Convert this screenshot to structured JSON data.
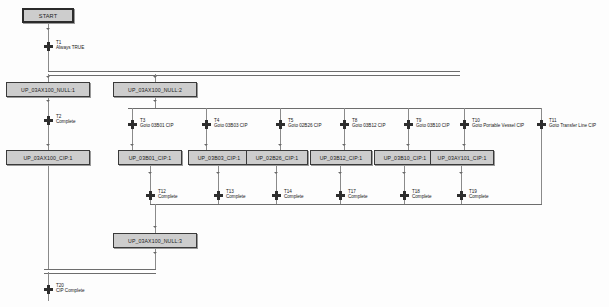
{
  "diagram": {
    "type": "sequential-function-chart",
    "colors": {
      "step_fill": "#cdcdcd",
      "step_border": "#3a3a3a",
      "link": "#8a8a8a",
      "transition": "#2e2e2e",
      "background": "#fdfdfd"
    }
  },
  "steps": [
    {
      "id": "start",
      "label": "START",
      "x": 22,
      "y": 8,
      "w": 52,
      "h": 15,
      "kind": "initial"
    },
    {
      "id": "null1",
      "label": "UP_03AX100_NULL:1",
      "x": 6,
      "y": 82,
      "w": 84,
      "h": 15,
      "kind": "step"
    },
    {
      "id": "null2",
      "label": "UP_03AX100_NULL:2",
      "x": 113,
      "y": 82,
      "w": 84,
      "h": 15,
      "kind": "step"
    },
    {
      "id": "cipAX100",
      "label": "UP_03AX100_CIP:1",
      "x": 6,
      "y": 150,
      "w": 84,
      "h": 15,
      "kind": "step"
    },
    {
      "id": "cip03B01",
      "label": "UP_03B01_CIP:1",
      "x": 116,
      "y": 150,
      "w": 64,
      "h": 15,
      "kind": "step"
    },
    {
      "id": "cip03B03",
      "label": "UP_03B03_CIP:1",
      "x": 190,
      "y": 150,
      "w": 64,
      "h": 15,
      "kind": "step"
    },
    {
      "id": "cip02B26",
      "label": "UP_02B26_CIP:1",
      "x": 258,
      "y": 150,
      "w": 64,
      "h": 15,
      "kind": "step"
    },
    {
      "id": "cip03B12",
      "label": "UP_03B12_CIP:1",
      "x": 332,
      "y": 150,
      "w": 64,
      "h": 15,
      "kind": "step"
    },
    {
      "id": "cip03B10",
      "label": "UP_03B10_CIP:1",
      "x": 400,
      "y": 150,
      "w": 60,
      "h": 15,
      "kind": "step"
    },
    {
      "id": "cip03AY101",
      "label": "UP_03AY101_CIP:1",
      "x": 428,
      "y": 150,
      "w": 66,
      "h": 15,
      "kind": "step"
    },
    {
      "id": "null3",
      "label": "UP_03AX100_NULL:3",
      "x": 113,
      "y": 233,
      "w": 84,
      "h": 15,
      "kind": "step"
    }
  ],
  "transitions": [
    {
      "id": "T1",
      "name": "T1",
      "desc": "Always TRUE",
      "x": 44,
      "y": 42,
      "lx": 56,
      "ly": 40
    },
    {
      "id": "T2",
      "name": "T2",
      "desc": "Complete",
      "x": 44,
      "y": 116,
      "lx": 56,
      "ly": 114
    },
    {
      "id": "T3",
      "name": "T3",
      "desc": "Goto 03B01 CIP",
      "x": 128,
      "y": 120,
      "lx": 140,
      "ly": 118
    },
    {
      "id": "T4",
      "name": "T4",
      "desc": "Goto 03B03 CIP",
      "x": 202,
      "y": 120,
      "lx": 214,
      "ly": 118
    },
    {
      "id": "T5",
      "name": "T5",
      "desc": "Goto 02B26 CIP",
      "x": 276,
      "y": 120,
      "lx": 288,
      "ly": 118
    },
    {
      "id": "T8",
      "name": "T8",
      "desc": "Goto 03B12 CIP",
      "x": 340,
      "y": 120,
      "lx": 352,
      "ly": 118
    },
    {
      "id": "T9",
      "name": "T9",
      "desc": "Goto 03B10 CIP",
      "x": 404,
      "y": 120,
      "lx": 416,
      "ly": 118
    },
    {
      "id": "T10",
      "name": "T10",
      "desc": "Goto Portable Vessel CIP",
      "x": 460,
      "y": 120,
      "lx": 472,
      "ly": 118
    },
    {
      "id": "T11",
      "name": "T11",
      "desc": "Goto Transfer Line CIP",
      "x": 537,
      "y": 120,
      "lx": 549,
      "ly": 118
    },
    {
      "id": "T12",
      "name": "T12",
      "desc": "Complete",
      "x": 146,
      "y": 191,
      "lx": 158,
      "ly": 189
    },
    {
      "id": "T13",
      "name": "T13",
      "desc": "Complete",
      "x": 214,
      "y": 191,
      "lx": 226,
      "ly": 189
    },
    {
      "id": "T14",
      "name": "T14",
      "desc": "Complete",
      "x": 272,
      "y": 191,
      "lx": 284,
      "ly": 189
    },
    {
      "id": "T17",
      "name": "T17",
      "desc": "Complete",
      "x": 336,
      "y": 191,
      "lx": 348,
      "ly": 189
    },
    {
      "id": "T18",
      "name": "T18",
      "desc": "Complete",
      "x": 400,
      "y": 191,
      "lx": 412,
      "ly": 189
    },
    {
      "id": "T19",
      "name": "T19",
      "desc": "Complete",
      "x": 457,
      "y": 191,
      "lx": 469,
      "ly": 189
    },
    {
      "id": "T20",
      "name": "T20",
      "desc": "CIP Complete",
      "x": 44,
      "y": 285,
      "lx": 56,
      "ly": 283
    }
  ]
}
